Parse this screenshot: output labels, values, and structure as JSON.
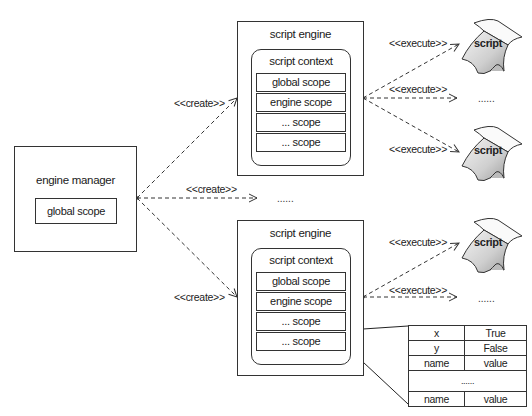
{
  "engine_manager": {
    "title": "engine manager",
    "scope": "global scope"
  },
  "engines": [
    {
      "title": "script engine",
      "context": {
        "title": "script context",
        "scopes": [
          "global scope",
          "engine scope",
          "... scope",
          "... scope"
        ]
      },
      "executes": [
        {
          "label": "<<execute>>",
          "target": "script"
        },
        {
          "label": "<<execute>>",
          "target": "......"
        },
        {
          "label": "<<execute>>",
          "target": "script"
        }
      ]
    },
    {
      "title": "script engine",
      "context": {
        "title": "script context",
        "scopes": [
          "global scope",
          "engine scope",
          "... scope",
          "... scope"
        ]
      },
      "executes": [
        {
          "label": "<<execute>>",
          "target": "script"
        },
        {
          "label": "<<execute>>",
          "target": "......"
        }
      ]
    }
  ],
  "creates": [
    {
      "label": "<<create>>"
    },
    {
      "label": "<<create>>",
      "target": "......"
    },
    {
      "label": "<<create>>"
    }
  ],
  "bindings_table": {
    "rows": [
      [
        "x",
        "True"
      ],
      [
        "y",
        "False"
      ],
      [
        "name",
        "value"
      ],
      [
        "......"
      ],
      [
        "name",
        "value"
      ]
    ]
  },
  "colors": {
    "stroke": "#333333",
    "script_fill_light": "#f2f2f2",
    "script_fill_dark": "#bdbdbd"
  }
}
